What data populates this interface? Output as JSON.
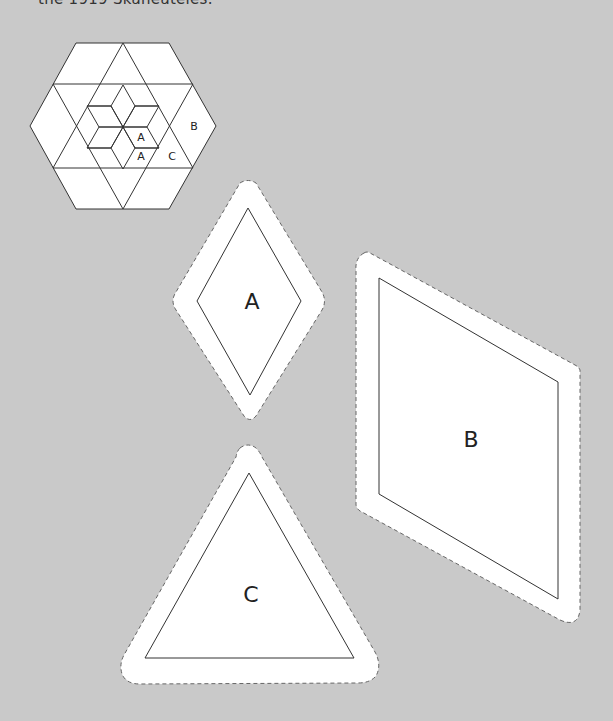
{
  "caption": "the 1919 Skaneateles.",
  "colors": {
    "background": "#c9c9c9",
    "piece_fill": "#ffffff",
    "line": "#333333",
    "dash": "#666666"
  },
  "diagram": {
    "block_labels": [
      "A",
      "A",
      "C",
      "B"
    ]
  },
  "templates": {
    "a": {
      "label": "A"
    },
    "b": {
      "label": "B"
    },
    "c": {
      "label": "C"
    }
  }
}
